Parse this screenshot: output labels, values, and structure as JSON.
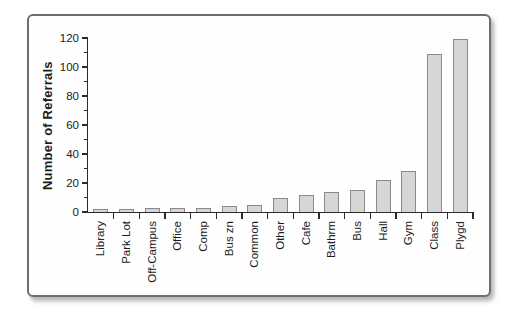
{
  "figure": {
    "kind": "framed scanned textbook bar chart figure",
    "background": "#ffffff"
  },
  "chart_data": {
    "type": "bar",
    "title": "",
    "xlabel": "",
    "ylabel": "Number of Referrals",
    "categories": [
      "Library",
      "Park Lot",
      "Off-Campus",
      "Office",
      "Comp",
      "Bus zn",
      "Common",
      "Other",
      "Cafe",
      "Bathrm",
      "Bus",
      "Hall",
      "Gym",
      "Class",
      "Plygd"
    ],
    "values": [
      2,
      2,
      3,
      3,
      3,
      4,
      5,
      10,
      12,
      14,
      15,
      22,
      28,
      109,
      119
    ],
    "ylim": [
      0,
      120
    ],
    "ytick_step": 20,
    "yminor_step": 10,
    "yticks": [
      0,
      20,
      40,
      60,
      80,
      100,
      120
    ],
    "grid": "off",
    "legend": "none",
    "bar_orientation": "vertical",
    "x_labels_rotated_degrees": 90,
    "colors": {
      "bar_fill": "#d6d6d6",
      "bar_border": "#8a8a8a",
      "axis": "#2b2b2b",
      "text": "#1c1c1c",
      "frame_border": "#6e6e6e"
    }
  }
}
